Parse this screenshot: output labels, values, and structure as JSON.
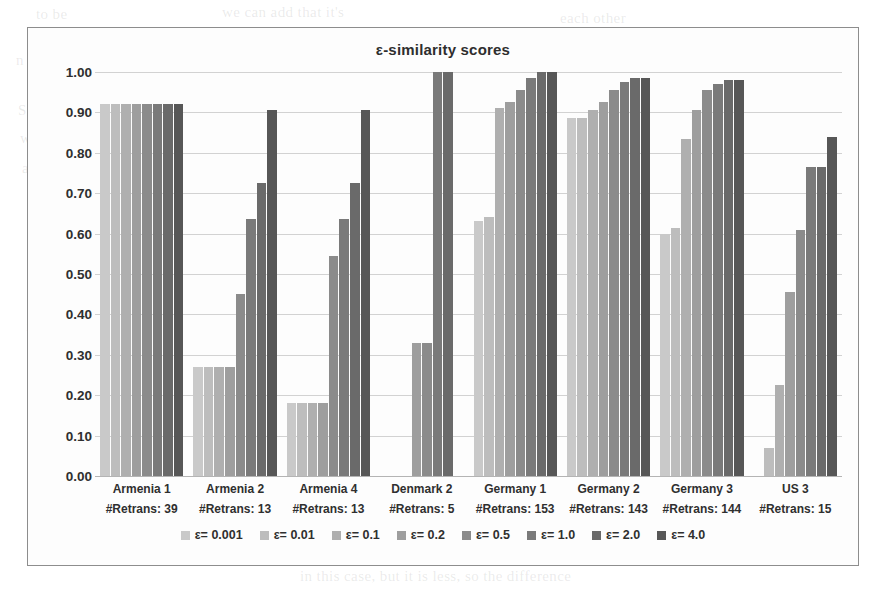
{
  "chart_data": {
    "type": "bar",
    "title": "ε-similarity scores",
    "xlabel": "",
    "ylabel": "",
    "ylim": [
      0.0,
      1.0
    ],
    "grid": true,
    "legend_position": "bottom",
    "y_ticks": [
      "1.00",
      "0.90",
      "0.80",
      "0.70",
      "0.60",
      "0.50",
      "0.40",
      "0.30",
      "0.20",
      "0.10",
      "0.00"
    ],
    "y_tick_values": [
      1.0,
      0.9,
      0.8,
      0.7,
      0.6,
      0.5,
      0.4,
      0.3,
      0.2,
      0.1,
      0.0
    ],
    "categories": [
      "Armenia 1",
      "Armenia 2",
      "Armenia 4",
      "Denmark 2",
      "Germany 1",
      "Germany 2",
      "Germany 3",
      "US 3"
    ],
    "category_sublabels": [
      "#Retrans: 39",
      "#Retrans: 13",
      "#Retrans: 13",
      "#Retrans: 5",
      "#Retrans: 153",
      "#Retrans: 143",
      "#Retrans: 144",
      "#Retrans: 15"
    ],
    "retrans_counts": [
      39,
      13,
      13,
      5,
      153,
      143,
      144,
      15
    ],
    "series": [
      {
        "name": "ε= 0.001",
        "color": "#c9c9c9",
        "values": [
          0.92,
          0.27,
          0.18,
          0.0,
          0.63,
          0.885,
          0.6,
          0.0
        ]
      },
      {
        "name": "ε= 0.01",
        "color": "#bdbdbd",
        "values": [
          0.92,
          0.27,
          0.18,
          0.0,
          0.64,
          0.885,
          0.615,
          0.07
        ]
      },
      {
        "name": "ε= 0.1",
        "color": "#afafaf",
        "values": [
          0.92,
          0.27,
          0.18,
          0.0,
          0.91,
          0.905,
          0.835,
          0.225
        ]
      },
      {
        "name": "ε= 0.2",
        "color": "#9e9e9e",
        "values": [
          0.92,
          0.27,
          0.18,
          0.33,
          0.925,
          0.925,
          0.905,
          0.455
        ]
      },
      {
        "name": "ε= 0.5",
        "color": "#8b8b8b",
        "values": [
          0.92,
          0.45,
          0.545,
          0.33,
          0.955,
          0.955,
          0.955,
          0.61
        ]
      },
      {
        "name": "ε= 1.0",
        "color": "#7a7a7a",
        "values": [
          0.92,
          0.635,
          0.635,
          1.0,
          0.985,
          0.975,
          0.97,
          0.765
        ]
      },
      {
        "name": "ε= 2.0",
        "color": "#6a6a6a",
        "values": [
          0.92,
          0.725,
          0.725,
          1.0,
          1.0,
          0.985,
          0.98,
          0.765
        ]
      },
      {
        "name": "ε= 4.0",
        "color": "#575757",
        "values": [
          0.92,
          0.905,
          0.905,
          0.0,
          1.0,
          0.985,
          0.98,
          0.84
        ]
      }
    ]
  },
  "bleed_text": [
    {
      "text": "to be",
      "left": 36,
      "top": 6
    },
    {
      "text": "we can add that it's",
      "left": 222,
      "top": 4
    },
    {
      "text": "each other",
      "left": 560,
      "top": 10
    },
    {
      "text": "n of the",
      "left": 16,
      "top": 52
    },
    {
      "text": "at this point,",
      "left": 255,
      "top": 50
    },
    {
      "text": "we",
      "left": 640,
      "top": 58
    },
    {
      "text": "So",
      "left": 18,
      "top": 102
    },
    {
      "text": "e in the",
      "left": 690,
      "top": 98
    },
    {
      "text": "which",
      "left": 20,
      "top": 130
    },
    {
      "text": "values of the",
      "left": 700,
      "top": 128
    },
    {
      "text": "and",
      "left": 22,
      "top": 160
    },
    {
      "text": "responses of a particular",
      "left": 630,
      "top": 158
    },
    {
      "text": "and for all the",
      "left": 364,
      "top": 232
    },
    {
      "text": "it is",
      "left": 26,
      "top": 318
    },
    {
      "text": "and",
      "left": 30,
      "top": 398
    },
    {
      "text": "but we have",
      "left": 620,
      "top": 512
    },
    {
      "text": "and for the",
      "left": 640,
      "top": 534
    },
    {
      "text": "in this case, but it is less, so the difference",
      "left": 300,
      "top": 568
    }
  ]
}
